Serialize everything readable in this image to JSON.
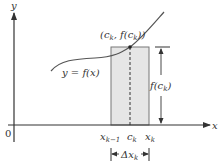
{
  "diagram": {
    "axes": {
      "x_label": "x",
      "y_label": "y",
      "origin_label": "0"
    },
    "curve": {
      "label": "y = f(x)"
    },
    "point": {
      "label": "(cₖ, f(cₖ))",
      "label_parts": [
        "(c",
        "k",
        ", f(c",
        "k",
        "))"
      ]
    },
    "ticks": {
      "left": {
        "base": "x",
        "sub": "k−1"
      },
      "mid": {
        "base": "c",
        "sub": "k"
      },
      "right": {
        "base": "x",
        "sub": "k"
      }
    },
    "height_label": {
      "base": "f(c",
      "sub": "k",
      "tail": ")"
    },
    "width_label": {
      "base": "Δx",
      "sub": "k"
    },
    "colors": {
      "axis": "#333333",
      "rect_fill": "#e6e6e6",
      "rect_stroke": "#777777",
      "curve": "#555555"
    }
  }
}
